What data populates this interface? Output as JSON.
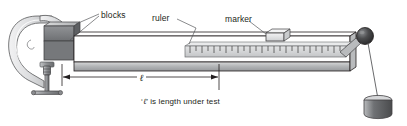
{
  "figure": {
    "type": "technical-line-diagram",
    "width": 407,
    "height": 126,
    "background": "#ffffff"
  },
  "labels": {
    "blocks": "blocks",
    "ruler": "ruler",
    "marker": "marker",
    "length_symbol": "ℓ",
    "caption_prefix": "‘",
    "caption_symbol": "ℓ",
    "caption_suffix": "’ is length under test",
    "caption_full": "‘ℓ’ is length under test"
  },
  "colors": {
    "outline": "#231f20",
    "leader": "#58595b",
    "bar_top": "#ffffff",
    "bar_edge": "#a7a9ac",
    "bar_shadow": "#808285",
    "block_fill": "#808285",
    "block_dark": "#6d6e71",
    "clamp_fill": "#e6e7e8",
    "clamp_shade": "#bcbec0",
    "ruler_fill": "#d1d3d4",
    "marker_fill": "#e6e7e8",
    "ball_fill": "#414042",
    "weight_fill": "#6d6e71",
    "weight_top": "#d1d3d4",
    "screw_fill": "#939598",
    "text": "#231f20"
  },
  "parts": {
    "clamp": {
      "name": "c-clamp",
      "has_screw": true,
      "has_t_handle": true
    },
    "blocks": {
      "name": "clamping-blocks",
      "count": 2
    },
    "bar": {
      "name": "test-bar",
      "orientation": "horizontal-cantilever"
    },
    "ruler": {
      "name": "measuring-ruler",
      "tick_count": 26
    },
    "marker": {
      "name": "sliding-marker"
    },
    "ball": {
      "name": "end-ball"
    },
    "wire": {
      "name": "suspension-wire"
    },
    "weight": {
      "name": "hanging-weight",
      "shape": "cylinder"
    },
    "dimension": {
      "name": "length-dimension-line",
      "symbol": "ℓ",
      "arrows": "both-ends"
    }
  }
}
